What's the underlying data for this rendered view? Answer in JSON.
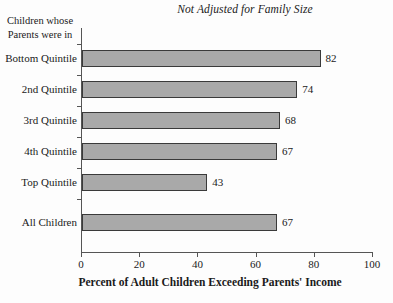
{
  "chart_data": {
    "type": "bar",
    "orientation": "horizontal",
    "title": "Not Adjusted for Family Size",
    "xlabel": "Percent of Adult Children Exceeding Parents' Income",
    "ylabel": "Children whose Parents were in",
    "ylabel_lines": [
      "Children whose",
      "Parents were in"
    ],
    "categories": [
      "Bottom Quintile",
      "2nd Quintile",
      "3rd Quintile",
      "4th Quintile",
      "Top Quintile",
      "All Children"
    ],
    "values": [
      82,
      74,
      68,
      67,
      43,
      67
    ],
    "xlim": [
      0,
      100
    ],
    "xticks": [
      0,
      20,
      40,
      60,
      80,
      100
    ],
    "xtick_labels": [
      "0",
      "20",
      "40",
      "60",
      "80",
      "100"
    ],
    "grid": false,
    "legend": false,
    "bar_color": "#a9a9a9",
    "bar_edge_color": "#3a3a3a",
    "axis_color": "#555555",
    "background_color": "#fdfdfd",
    "text_color": "#1a1a1a",
    "gap_before_last_category": true
  }
}
